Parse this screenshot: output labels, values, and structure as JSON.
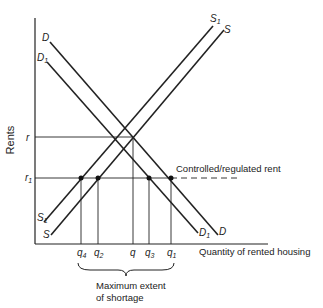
{
  "diagram": {
    "y_axis_label": "Rents",
    "x_axis_label": "Quantity of rented housing",
    "rent_levels": [
      {
        "id": "r",
        "label": "r"
      },
      {
        "id": "r1",
        "label": "r",
        "sub": "1"
      }
    ],
    "controlled_rent_label": "Controlled/regulated rent",
    "curves": {
      "D": {
        "label": "D",
        "sub": ""
      },
      "D1": {
        "label": "D",
        "sub": "1"
      },
      "S": {
        "label": "S",
        "sub": ""
      },
      "S1": {
        "label": "S",
        "sub": "1"
      }
    },
    "quantities": [
      {
        "id": "q4",
        "label": "q",
        "sub": "4"
      },
      {
        "id": "q2",
        "label": "q",
        "sub": "2"
      },
      {
        "id": "q",
        "label": "q",
        "sub": ""
      },
      {
        "id": "q3",
        "label": "q",
        "sub": "3"
      },
      {
        "id": "q1",
        "label": "q",
        "sub": "1"
      }
    ],
    "brace_label_line1": "Maximum extent",
    "brace_label_line2": "of shortage"
  }
}
